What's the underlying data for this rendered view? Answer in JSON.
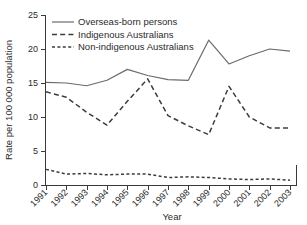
{
  "chart_data": {
    "type": "line",
    "title": "",
    "xlabel": "Year",
    "ylabel": "Rate per 100 000 population",
    "categories": [
      "1991",
      "1992",
      "1993",
      "1994",
      "1995",
      "1996",
      "1997",
      "1998",
      "1999",
      "2000",
      "2001",
      "2002",
      "2003"
    ],
    "x": [
      1991,
      1992,
      1993,
      1994,
      1995,
      1996,
      1997,
      1998,
      1999,
      2000,
      2001,
      2002,
      2003
    ],
    "xlim": [
      1991,
      2003
    ],
    "ylim": [
      0,
      25
    ],
    "yticks": [
      0,
      5,
      10,
      15,
      20,
      25
    ],
    "ytick_labels": [
      "0",
      "5",
      "10",
      "15",
      "20",
      "25"
    ],
    "grid": false,
    "legend_position": "top-left",
    "series": [
      {
        "name": "Overseas-born persons",
        "style": "solid",
        "values": [
          15.1,
          15.0,
          14.6,
          15.4,
          17.0,
          16.1,
          15.5,
          15.4,
          21.3,
          17.8,
          19.0,
          20.0,
          19.7
        ]
      },
      {
        "name": "Indigenous Australians",
        "style": "dashed-long",
        "values": [
          13.7,
          12.9,
          10.7,
          8.8,
          12.3,
          15.6,
          10.2,
          8.7,
          7.4,
          14.5,
          10.0,
          8.4,
          8.4
        ]
      },
      {
        "name": "Non-indigenous Australians",
        "style": "dashed-short",
        "values": [
          2.3,
          1.6,
          1.7,
          1.5,
          1.6,
          1.6,
          1.1,
          1.2,
          1.1,
          0.9,
          0.8,
          0.9,
          0.7
        ]
      }
    ]
  },
  "axes": {
    "y_axis_title": "Rate per 100 000 population",
    "x_axis_title": "Year"
  },
  "legend": {
    "items": [
      {
        "label": "Overseas-born persons"
      },
      {
        "label": "Indigenous Australians"
      },
      {
        "label": "Non-indigenous Australians"
      }
    ]
  }
}
